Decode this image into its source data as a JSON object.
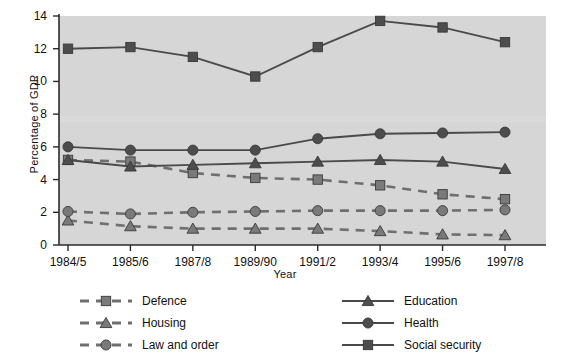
{
  "chart_data": {
    "type": "line",
    "title": "",
    "xlabel": "Year",
    "ylabel": "Percentage of GDP",
    "categories": [
      "1984/5",
      "1985/6",
      "1987/8",
      "1989/90",
      "1991/2",
      "1993/4",
      "1995/6",
      "1997/8"
    ],
    "ylim": [
      0,
      14
    ],
    "yticks": [
      0,
      2,
      4,
      6,
      8,
      10,
      12,
      14
    ],
    "ytick_labels": [
      "0",
      "2",
      "4",
      "6",
      "8",
      "10",
      "12",
      "14"
    ],
    "grid": false,
    "legend_position": "below",
    "plot_background": "#d6d6d6",
    "series": [
      {
        "name": "Defence",
        "marker": "square",
        "line_style": "dashed",
        "color": "#7a7a7a",
        "values": [
          5.2,
          5.1,
          4.4,
          4.1,
          4.0,
          3.65,
          3.1,
          2.8
        ]
      },
      {
        "name": "Housing",
        "marker": "triangle",
        "line_style": "dashed",
        "color": "#7a7a7a",
        "values": [
          1.5,
          1.15,
          1.0,
          1.0,
          1.0,
          0.85,
          0.65,
          0.6
        ]
      },
      {
        "name": "Law and order",
        "marker": "circle",
        "line_style": "dashed",
        "color": "#7a7a7a",
        "values": [
          2.05,
          1.9,
          2.0,
          2.05,
          2.1,
          2.1,
          2.1,
          2.15
        ]
      },
      {
        "name": "Education",
        "marker": "triangle",
        "line_style": "solid",
        "color": "#4d4d4d",
        "values": [
          5.2,
          4.8,
          4.9,
          5.0,
          5.1,
          5.2,
          5.1,
          4.65
        ]
      },
      {
        "name": "Health",
        "marker": "circle",
        "line_style": "solid",
        "color": "#4d4d4d",
        "values": [
          6.0,
          5.8,
          5.8,
          5.8,
          6.5,
          6.8,
          6.85,
          6.9
        ]
      },
      {
        "name": "Social security",
        "marker": "square",
        "line_style": "solid",
        "color": "#4d4d4d",
        "values": [
          12.0,
          12.1,
          11.5,
          10.3,
          12.1,
          13.7,
          13.3,
          12.4
        ]
      }
    ]
  },
  "legend": {
    "entries": [
      {
        "label": "Defence",
        "series": 0
      },
      {
        "label": "Housing",
        "series": 1
      },
      {
        "label": "Law and order",
        "series": 2
      },
      {
        "label": "Education",
        "series": 3
      },
      {
        "label": "Health",
        "series": 4
      },
      {
        "label": "Social security",
        "series": 5
      }
    ]
  }
}
